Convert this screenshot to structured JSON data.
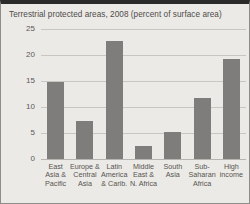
{
  "chart_data": {
    "type": "bar",
    "title": "Terrestrial protected areas, 2008 (percent of surface area)",
    "xlabel": "",
    "ylabel": "",
    "ylim": [
      0,
      25
    ],
    "yticks": [
      0,
      5,
      10,
      15,
      20,
      25
    ],
    "grid": true,
    "legend": "none",
    "bar_color": "#7e7d7b",
    "background_color": "#eceae7",
    "categories": [
      "East\nAsia &\nPacific",
      "Europe &\nCentral\nAsia",
      "Latin\nAmerica\n& Carib.",
      "Middle\nEast &\nN. Africa",
      "South\nAsia",
      "Sub-\nSaharan\nAfrica",
      "High\nincome"
    ],
    "values": [
      14.8,
      7.3,
      22.7,
      2.5,
      5.2,
      11.7,
      19.3
    ]
  }
}
